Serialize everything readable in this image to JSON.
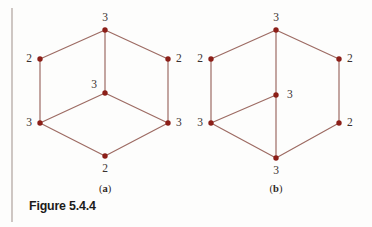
{
  "figure": {
    "caption": "Figure 5.4.4",
    "rule_color": "#a89a94",
    "edge_color": "#9d6b63",
    "vertex_color": "#8c1f18",
    "label_color": "#3a3230",
    "background": "#fdfdfc"
  },
  "subfigures": [
    {
      "id": "a",
      "label": "(a)",
      "label_x": 105,
      "label_y": 189,
      "graph": {
        "type": "undirected",
        "description": "Hexagon with a central vertex joined to the top, lower-left and lower-right vertices; degree sequence labels shown at each vertex.",
        "vertices": [
          {
            "id": "a-top",
            "name": "top",
            "x": 105,
            "y": 30,
            "degree": "3",
            "label_x": 105,
            "label_y": 18,
            "label_anchor": "middle"
          },
          {
            "id": "a-upper-left",
            "name": "upper-left",
            "x": 40,
            "y": 59,
            "degree": "2",
            "label_x": 32,
            "label_y": 59,
            "label_anchor": "end"
          },
          {
            "id": "a-upper-right",
            "name": "upper-right",
            "x": 168,
            "y": 59,
            "degree": "2",
            "label_x": 176,
            "label_y": 59,
            "label_anchor": "start"
          },
          {
            "id": "a-center",
            "name": "center",
            "x": 105,
            "y": 93,
            "degree": "3",
            "label_x": 97,
            "label_y": 85,
            "label_anchor": "end"
          },
          {
            "id": "a-lower-left",
            "name": "lower-left",
            "x": 40,
            "y": 123,
            "degree": "3",
            "label_x": 32,
            "label_y": 123,
            "label_anchor": "end"
          },
          {
            "id": "a-lower-right",
            "name": "lower-right",
            "x": 168,
            "y": 123,
            "degree": "3",
            "label_x": 176,
            "label_y": 123,
            "label_anchor": "start"
          },
          {
            "id": "a-bottom",
            "name": "bottom",
            "x": 105,
            "y": 156,
            "degree": "2",
            "label_x": 105,
            "label_y": 169,
            "label_anchor": "middle"
          }
        ],
        "edges": [
          [
            "a-top",
            "a-upper-left"
          ],
          [
            "a-top",
            "a-upper-right"
          ],
          [
            "a-upper-left",
            "a-lower-left"
          ],
          [
            "a-upper-right",
            "a-lower-right"
          ],
          [
            "a-lower-left",
            "a-bottom"
          ],
          [
            "a-lower-right",
            "a-bottom"
          ],
          [
            "a-top",
            "a-center"
          ],
          [
            "a-center",
            "a-lower-left"
          ],
          [
            "a-center",
            "a-lower-right"
          ]
        ]
      }
    },
    {
      "id": "b",
      "label": "(b)",
      "label_x": 276,
      "label_y": 189,
      "graph": {
        "type": "undirected",
        "description": "Hexagon with a central vertex joined to the top, lower-left and bottom vertices; degree sequence labels shown at each vertex.",
        "vertices": [
          {
            "id": "b-top",
            "name": "top",
            "x": 276,
            "y": 30,
            "degree": "3",
            "label_x": 276,
            "label_y": 18,
            "label_anchor": "middle"
          },
          {
            "id": "b-upper-left",
            "name": "upper-left",
            "x": 211,
            "y": 59,
            "degree": "2",
            "label_x": 203,
            "label_y": 59,
            "label_anchor": "end"
          },
          {
            "id": "b-upper-right",
            "name": "upper-right",
            "x": 339,
            "y": 59,
            "degree": "2",
            "label_x": 347,
            "label_y": 59,
            "label_anchor": "start"
          },
          {
            "id": "b-center",
            "name": "center",
            "x": 276,
            "y": 95,
            "degree": "3",
            "label_x": 287,
            "label_y": 95,
            "label_anchor": "start"
          },
          {
            "id": "b-lower-left",
            "name": "lower-left",
            "x": 211,
            "y": 123,
            "degree": "3",
            "label_x": 203,
            "label_y": 123,
            "label_anchor": "end"
          },
          {
            "id": "b-lower-right",
            "name": "lower-right",
            "x": 339,
            "y": 123,
            "degree": "2",
            "label_x": 347,
            "label_y": 123,
            "label_anchor": "start"
          },
          {
            "id": "b-bottom",
            "name": "bottom",
            "x": 276,
            "y": 158,
            "degree": "3",
            "label_x": 276,
            "label_y": 171,
            "label_anchor": "middle"
          }
        ],
        "edges": [
          [
            "b-top",
            "b-upper-left"
          ],
          [
            "b-top",
            "b-upper-right"
          ],
          [
            "b-upper-left",
            "b-lower-left"
          ],
          [
            "b-upper-right",
            "b-lower-right"
          ],
          [
            "b-lower-left",
            "b-bottom"
          ],
          [
            "b-lower-right",
            "b-bottom"
          ],
          [
            "b-top",
            "b-center"
          ],
          [
            "b-center",
            "b-lower-left"
          ],
          [
            "b-center",
            "b-bottom"
          ]
        ]
      }
    }
  ],
  "margin_rule": {
    "x": 12,
    "y1": 8,
    "y2": 222
  }
}
